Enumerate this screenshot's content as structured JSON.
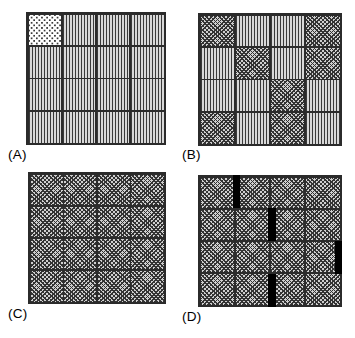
{
  "figure": {
    "title": "",
    "background_color": "#ffffff",
    "grid_line_color": "#2b2b2b",
    "defect_color": "#000000",
    "panel_count": 4,
    "grid_rows": 4,
    "grid_columns": 4
  },
  "patterns": {
    "stripe": "vertical-stripe-fill",
    "cross": "cross-hatch-fill",
    "dot": "dotted-fill",
    "defect": "solid-black-bar"
  },
  "panels": [
    {
      "id": "panel-a",
      "label": "(A)",
      "x": 26,
      "y": 12,
      "width": 140,
      "height": 133,
      "label_x": 8,
      "label_y": 147,
      "cells": [
        [
          "dot",
          "stripe",
          "stripe",
          "stripe"
        ],
        [
          "stripe",
          "stripe",
          "stripe",
          "stripe"
        ],
        [
          "stripe",
          "stripe",
          "stripe",
          "stripe"
        ],
        [
          "stripe",
          "stripe",
          "stripe",
          "stripe"
        ]
      ],
      "defects": []
    },
    {
      "id": "panel-b",
      "label": "(B)",
      "x": 198,
      "y": 13,
      "width": 144,
      "height": 133,
      "label_x": 182,
      "label_y": 147,
      "cells": [
        [
          "cross",
          "stripe",
          "stripe",
          "cross"
        ],
        [
          "stripe",
          "cross",
          "stripe",
          "cross"
        ],
        [
          "stripe",
          "stripe",
          "cross",
          "stripe"
        ],
        [
          "cross",
          "stripe",
          "cross",
          "stripe"
        ]
      ],
      "defects": []
    },
    {
      "id": "panel-c",
      "label": "(C)",
      "x": 28,
      "y": 172,
      "width": 138,
      "height": 132,
      "label_x": 8,
      "label_y": 306,
      "cells": [
        [
          "cross",
          "cross",
          "cross",
          "cross"
        ],
        [
          "cross",
          "cross",
          "cross",
          "cross"
        ],
        [
          "cross",
          "cross",
          "cross",
          "cross"
        ],
        [
          "cross",
          "cross",
          "cross",
          "cross"
        ]
      ],
      "defects": []
    },
    {
      "id": "panel-d",
      "label": "(D)",
      "x": 198,
      "y": 175,
      "width": 144,
      "height": 132,
      "label_x": 182,
      "label_y": 309,
      "cells": [
        [
          "cross",
          "cross",
          "cross",
          "cross"
        ],
        [
          "cross",
          "cross",
          "cross",
          "cross"
        ],
        [
          "cross",
          "cross",
          "cross",
          "cross"
        ],
        [
          "cross",
          "cross",
          "cross",
          "cross"
        ]
      ],
      "defects": [
        {
          "row": 1,
          "boundary": "col1-col2",
          "left_pct": 24.0,
          "width_pct": 5.5,
          "top_pct": 0.0,
          "height_pct": 25.0
        },
        {
          "row": 2,
          "boundary": "col2-col3",
          "left_pct": 48.5,
          "width_pct": 5.5,
          "top_pct": 25.0,
          "height_pct": 25.0
        },
        {
          "row": 3,
          "boundary": "col4-edge",
          "left_pct": 95.0,
          "width_pct": 5.0,
          "top_pct": 50.0,
          "height_pct": 25.0
        },
        {
          "row": 4,
          "boundary": "col2-col3",
          "left_pct": 48.5,
          "width_pct": 5.5,
          "top_pct": 75.0,
          "height_pct": 25.0
        }
      ]
    }
  ]
}
